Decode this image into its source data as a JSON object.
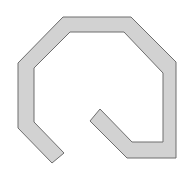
{
  "diagram": {
    "type": "open-octagonal-loop",
    "canvas": {
      "width": 179,
      "height": 176,
      "background": "#ffffff"
    },
    "shape": {
      "fill": "#d2d2d2",
      "stroke": "#6e6e6e",
      "stroke_width": 1,
      "points": "52,163 18,128 18,63 63,17 131,17 176,62 176,158 127,158 90,121 100,109 132,142 163,142 163,73 124,32 70,32 34,68 34,122 64,153"
    }
  }
}
